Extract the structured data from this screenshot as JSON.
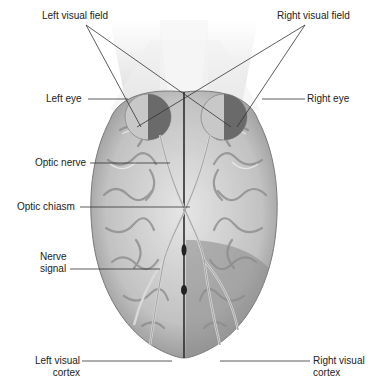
{
  "figure": {
    "labels": {
      "left_visual_field": "Left visual field",
      "right_visual_field": "Right visual field",
      "left_eye": "Left eye",
      "right_eye": "Right eye",
      "optic_nerve": "Optic nerve",
      "optic_chiasm": "Optic chiasm",
      "nerve_signal_line1": "Nerve",
      "nerve_signal_line2": "signal",
      "left_visual_cortex_line1": "Left visual",
      "left_visual_cortex_line2": "cortex",
      "right_visual_cortex_line1": "Right visual",
      "right_visual_cortex_line2": "cortex"
    },
    "colors": {
      "background": "#ffffff",
      "brain_light": "#d9d9d9",
      "brain_mid": "#a8a8a8",
      "brain_dark": "#6f6f6f",
      "right_cortex_shade": "#8a8a8a",
      "eye_dark_half": "#6a6a6a",
      "visual_field_cone": "#e4e4e4",
      "leader_line": "#333333"
    }
  }
}
